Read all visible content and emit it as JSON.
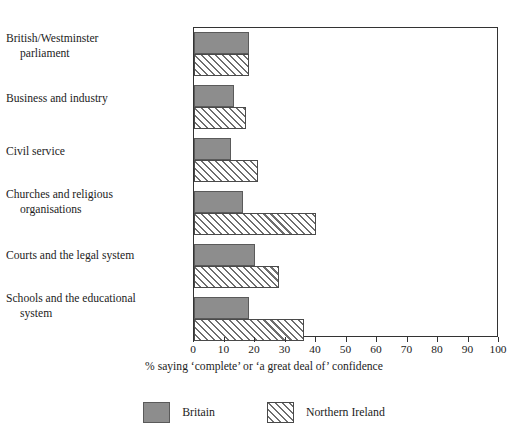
{
  "chart_data": {
    "type": "bar",
    "orientation": "horizontal",
    "title": "",
    "xlabel": "% saying ‘complete’ or ‘a great deal of’ confidence",
    "ylabel": "",
    "xlim": [
      0,
      100
    ],
    "xticks": [
      0,
      10,
      20,
      30,
      40,
      50,
      60,
      70,
      80,
      90,
      100
    ],
    "xtick_labels": [
      "0",
      "10",
      "20",
      "30",
      "40",
      "50",
      "60",
      "70",
      "80",
      "90",
      "100"
    ],
    "grid": false,
    "legend_position": "bottom",
    "categories": [
      "British/Westminster parliament",
      "Business and industry",
      "Civil service",
      "Churches and religious organisations",
      "Courts and the legal system",
      "Schools and the educational system"
    ],
    "category_lines": [
      [
        "British/Westminster",
        "parliament"
      ],
      [
        "Business and industry",
        ""
      ],
      [
        "Civil service",
        ""
      ],
      [
        "Churches and religious",
        "organisations"
      ],
      [
        "Courts and the legal system",
        ""
      ],
      [
        "Schools and the educational",
        "system"
      ]
    ],
    "series": [
      {
        "name": "Britain",
        "color": "#8d8d8d",
        "pattern": "solid",
        "values": [
          18,
          13,
          12,
          16,
          20,
          18
        ]
      },
      {
        "name": "Northern Ireland",
        "color": "#ffffff",
        "pattern": "diagonal-hatch",
        "values": [
          18,
          17,
          21,
          40,
          28,
          36
        ]
      }
    ]
  },
  "legend": {
    "items": [
      {
        "label": "Britain",
        "swatch": "solid-grey-swatch"
      },
      {
        "label": "Northern Ireland",
        "swatch": "hatched-swatch"
      }
    ]
  }
}
